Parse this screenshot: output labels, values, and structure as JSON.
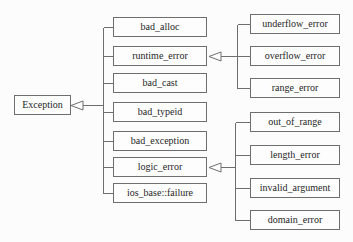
{
  "diagram": {
    "colors": {
      "line": "#6e6e6e",
      "box_border": "#6e6e6e",
      "box_fill": "#fdfdfd",
      "text": "#1f1f1f",
      "background": "#fcfcfc"
    },
    "nodes": {
      "root": "Exception",
      "middle": [
        "bad_alloc",
        "runtime_error",
        "bad_cast",
        "bad_typeid",
        "bad_exception",
        "logic_error",
        "ios_base::failure"
      ],
      "runtime_children": [
        "underflow_error",
        "overflow_error",
        "range_error"
      ],
      "logic_children": [
        "out_of_range",
        "length_error",
        "invalid_argument",
        "domain_error"
      ]
    }
  }
}
